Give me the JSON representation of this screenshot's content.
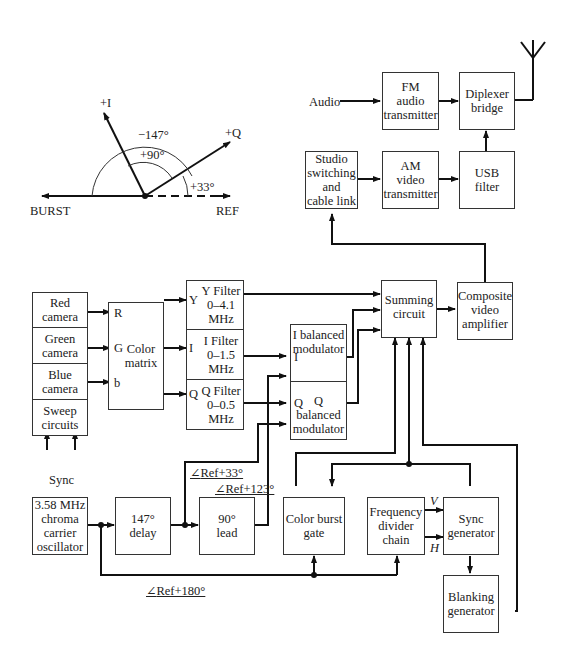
{
  "phasor_diagram": {
    "labels": {
      "plus_i": "+I",
      "plus_q": "+Q",
      "burst": "BURST",
      "ref": "REF",
      "angle_147": "−147°",
      "angle_90": "+90°",
      "angle_33": "+33°"
    }
  },
  "transmitter": {
    "audio_input": "Audio",
    "fm_audio": "FM\naudio\ntransmitter",
    "diplexer": "Diplexer\nbridge",
    "studio": "Studio\nswitching\nand\ncable link",
    "am_video": "AM\nvideo\ntransmitter",
    "usb_filter": "USB\nfilter",
    "antenna": "antenna-icon"
  },
  "cameras": {
    "red": "Red\ncamera",
    "green": "Green\ncamera",
    "blue": "Blue\ncamera",
    "sweep": "Sweep\ncircuits",
    "sync_label": "Sync"
  },
  "matrix": {
    "title": "Color\nmatrix",
    "in_r": "R",
    "in_g": "G",
    "in_b": "b",
    "out_y": "Y",
    "out_i": "I",
    "out_q": "Q"
  },
  "filters": {
    "y": "Y Filter\n0–4.1\nMHz",
    "i": "I Filter\n0–1.5\nMHz",
    "q": "Q Filter\n0–0.5\nMHz"
  },
  "modulators": {
    "i_title": "I balanced\nmodulator",
    "i_input": "I",
    "q_input": "Q",
    "q_title": "Q balanced\nmodulator"
  },
  "summing": "Summing\ncircuit",
  "composite": "Composite\nvideo\namplifier",
  "chroma": {
    "oscillator": "3.58 MHz\nchroma\ncarrier\noscillator",
    "delay": "147°\ndelay",
    "lead": "90°\nlead",
    "ref33": "Ref+33°",
    "ref123": "Ref+123°",
    "ref180": "Ref+180°"
  },
  "timing": {
    "burst_gate": "Color burst\ngate",
    "freq_divider": "Frequency\ndivider\nchain",
    "sync_gen": "Sync\ngenerator",
    "blanking": "Blanking\ngenerator",
    "v_label": "V",
    "h_label": "H"
  }
}
